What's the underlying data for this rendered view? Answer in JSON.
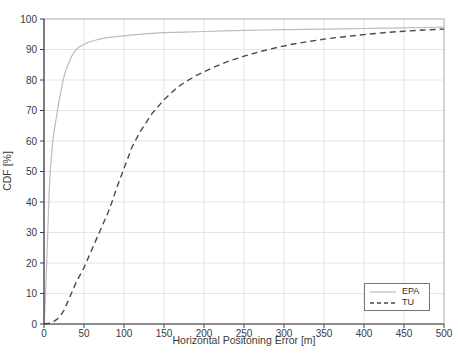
{
  "chart_data": {
    "type": "line",
    "title": "",
    "xlabel": "Horizontal Positoning Error [m]",
    "ylabel": "CDF [%]",
    "xlim": [
      0,
      500
    ],
    "ylim": [
      0,
      100
    ],
    "xticks": [
      0,
      50,
      100,
      150,
      200,
      250,
      300,
      350,
      400,
      450,
      500
    ],
    "yticks": [
      0,
      10,
      20,
      30,
      40,
      50,
      60,
      70,
      80,
      90,
      100
    ],
    "grid": true,
    "legend_position": "lower right",
    "series": [
      {
        "name": "EPA",
        "style": "solid",
        "color": "#bcbcbc",
        "points": [
          [
            0,
            0
          ],
          [
            1,
            4
          ],
          [
            2,
            10
          ],
          [
            3,
            17
          ],
          [
            4,
            25
          ],
          [
            5,
            32
          ],
          [
            6,
            40
          ],
          [
            7,
            46
          ],
          [
            8,
            51
          ],
          [
            9,
            54
          ],
          [
            10,
            57
          ],
          [
            11,
            60
          ],
          [
            13,
            64
          ],
          [
            15,
            67
          ],
          [
            18,
            72
          ],
          [
            21,
            76
          ],
          [
            24,
            80
          ],
          [
            27,
            83
          ],
          [
            30,
            85
          ],
          [
            34,
            87.5
          ],
          [
            38,
            89.3
          ],
          [
            42,
            90.4
          ],
          [
            47,
            91.3
          ],
          [
            55,
            92.3
          ],
          [
            65,
            93.1
          ],
          [
            75,
            93.7
          ],
          [
            90,
            94.2
          ],
          [
            100,
            94.5
          ],
          [
            115,
            94.9
          ],
          [
            130,
            95.2
          ],
          [
            150,
            95.5
          ],
          [
            175,
            95.7
          ],
          [
            200,
            95.9
          ],
          [
            225,
            96.1
          ],
          [
            250,
            96.25
          ],
          [
            275,
            96.4
          ],
          [
            300,
            96.5
          ],
          [
            325,
            96.6
          ],
          [
            350,
            96.7
          ],
          [
            375,
            96.8
          ],
          [
            400,
            96.9
          ],
          [
            425,
            97.0
          ],
          [
            450,
            97.1
          ],
          [
            475,
            97.2
          ],
          [
            500,
            97.3
          ]
        ]
      },
      {
        "name": "TU",
        "style": "dashed",
        "color": "#4a4a4a",
        "points": [
          [
            0,
            0
          ],
          [
            8,
            0.3
          ],
          [
            12,
            0.8
          ],
          [
            16,
            1.5
          ],
          [
            20,
            2.5
          ],
          [
            25,
            4.5
          ],
          [
            30,
            7.5
          ],
          [
            35,
            10.5
          ],
          [
            40,
            13.5
          ],
          [
            45,
            16
          ],
          [
            50,
            18.5
          ],
          [
            55,
            21.5
          ],
          [
            60,
            24.5
          ],
          [
            65,
            27.5
          ],
          [
            70,
            30.5
          ],
          [
            75,
            33.5
          ],
          [
            80,
            36.5
          ],
          [
            85,
            40
          ],
          [
            90,
            44
          ],
          [
            95,
            47.5
          ],
          [
            100,
            51
          ],
          [
            105,
            54.5
          ],
          [
            110,
            58
          ],
          [
            115,
            60.5
          ],
          [
            120,
            63
          ],
          [
            125,
            65
          ],
          [
            130,
            67
          ],
          [
            135,
            69
          ],
          [
            140,
            70.5
          ],
          [
            145,
            72
          ],
          [
            150,
            73.5
          ],
          [
            155,
            74.8
          ],
          [
            160,
            76
          ],
          [
            165,
            77.2
          ],
          [
            170,
            78.2
          ],
          [
            180,
            79.9
          ],
          [
            190,
            81.4
          ],
          [
            200,
            82.7
          ],
          [
            215,
            84.5
          ],
          [
            230,
            86.1
          ],
          [
            250,
            87.8
          ],
          [
            270,
            89.3
          ],
          [
            290,
            90.6
          ],
          [
            310,
            91.7
          ],
          [
            330,
            92.6
          ],
          [
            350,
            93.4
          ],
          [
            375,
            94.2
          ],
          [
            400,
            94.9
          ],
          [
            425,
            95.5
          ],
          [
            450,
            96
          ],
          [
            475,
            96.4
          ],
          [
            500,
            96.7
          ]
        ]
      }
    ],
    "colors": {
      "grid": "#e4e4e4",
      "frame": "#b8b8b8",
      "axis": "#3f3f3f",
      "tick_text": "#3a3a3a"
    }
  }
}
